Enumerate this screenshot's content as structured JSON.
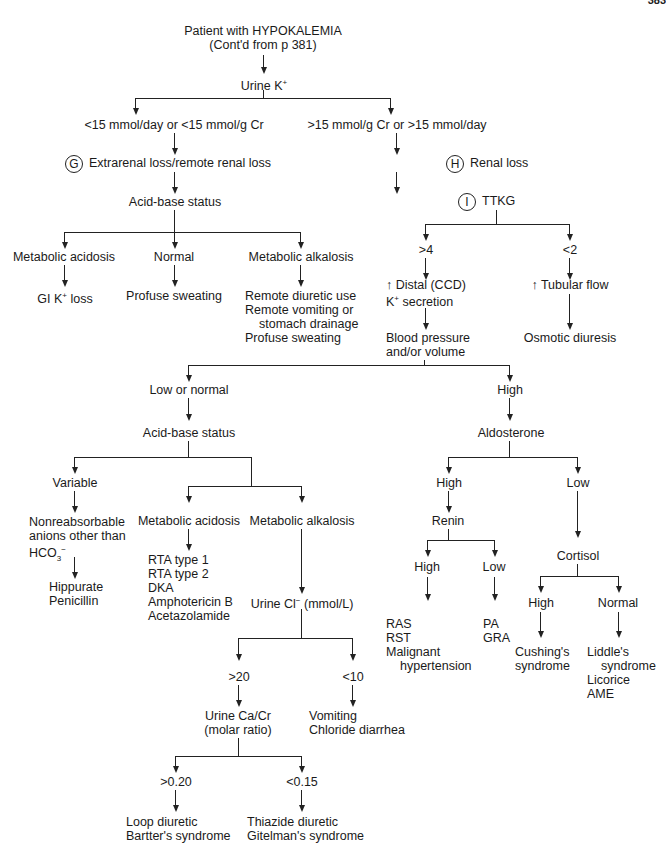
{
  "page": {
    "number": "383"
  },
  "root": {
    "line1": "Patient with HYPOKALEMIA",
    "line2": "(Cont'd from p 381)"
  },
  "urine_k": {
    "label": "Urine K",
    "sup": "+"
  },
  "left": {
    "threshold": "<15 mmol/day or <15 mmol/g Cr",
    "marker": "G",
    "loss": "Extrarenal loss/remote renal loss",
    "acid_base": "Acid-base status",
    "branches": {
      "acidosis": {
        "label": "Metabolic acidosis",
        "result_pre": "GI K",
        "result_sup": "+",
        "result_post": " loss"
      },
      "normal": {
        "label": "Normal",
        "result": "Profuse sweating"
      },
      "alkalosis": {
        "label": "Metabolic alkalosis",
        "results": [
          "Remote diuretic use",
          "Remote vomiting or",
          "stomach drainage",
          "Profuse sweating"
        ]
      }
    }
  },
  "right": {
    "threshold": ">15 mmol/g Cr or >15 mmol/day",
    "marker_h": "H",
    "loss": "Renal loss",
    "marker_i": "I",
    "ttkg": "TTKG",
    "gt4": {
      "label": ">4",
      "result_arrow": "↑",
      "result_line1": " Distal (CCD)",
      "result_line2_pre": "K",
      "result_line2_sup": "+",
      "result_line2_post": " secretion"
    },
    "lt2": {
      "label": "<2",
      "result_arrow": "↑",
      "result_text": " Tubular flow",
      "outcome": "Osmotic diuresis"
    },
    "bp": {
      "line1": "Blood pressure",
      "line2": "and/or volume"
    }
  },
  "low_normal": {
    "label": "Low or normal",
    "acid_base": "Acid-base status",
    "variable": {
      "label": "Variable",
      "desc1": "Nonreabsorbable",
      "desc2": "anions other than",
      "desc3_pre": "HCO",
      "desc3_sub": "3",
      "desc3_sup": "−",
      "results": [
        "Hippurate",
        "Penicillin"
      ]
    },
    "acidosis": {
      "label": "Metabolic acidosis",
      "results": [
        "RTA type 1",
        "RTA type 2",
        "DKA",
        "Amphotericin B",
        "Acetazolamide"
      ]
    },
    "alkalosis": {
      "label": "Metabolic alkalosis",
      "urine_cl_pre": "Urine Cl",
      "urine_cl_sup": "−",
      "urine_cl_post": " (mmol/L)",
      "gt20": {
        "label": ">20",
        "ca_cr1": "Urine Ca/Cr",
        "ca_cr2": "(molar ratio)",
        "gt020": {
          "label": ">0.20",
          "results": [
            "Loop diuretic",
            "Bartter's syndrome"
          ]
        },
        "lt015": {
          "label": "<0.15",
          "results": [
            "Thiazide diuretic",
            "Gitelman's syndrome"
          ]
        }
      },
      "lt10": {
        "label": "<10",
        "results": [
          "Vomiting",
          "Chloride diarrhea"
        ]
      }
    }
  },
  "high": {
    "label": "High",
    "aldosterone": "Aldosterone",
    "ald_high": {
      "label": "High",
      "renin": "Renin",
      "renin_high": {
        "label": "High",
        "results": [
          "RAS",
          "RST",
          "Malignant",
          "hypertension"
        ]
      },
      "renin_low": {
        "label": "Low",
        "results": [
          "PA",
          "GRA"
        ]
      }
    },
    "ald_low": {
      "label": "Low",
      "cortisol": "Cortisol",
      "cort_high": {
        "label": "High",
        "results": [
          "Cushing's",
          "syndrome"
        ]
      },
      "cort_normal": {
        "label": "Normal",
        "results": [
          "Liddle's",
          "syndrome",
          "Licorice",
          "AME"
        ]
      }
    }
  }
}
